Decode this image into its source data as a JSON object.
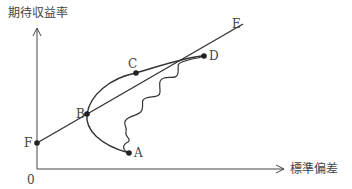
{
  "diagram": {
    "type": "efficient-frontier / capital market line",
    "y_axis_label": "期待収益率",
    "x_axis_label": "標準偏差",
    "origin_label": "0",
    "points": {
      "A": "A",
      "B": "B",
      "C": "C",
      "D": "D",
      "E": "E",
      "F": "F"
    },
    "colors": {
      "line": "#333333",
      "background": "#ffffff"
    }
  }
}
